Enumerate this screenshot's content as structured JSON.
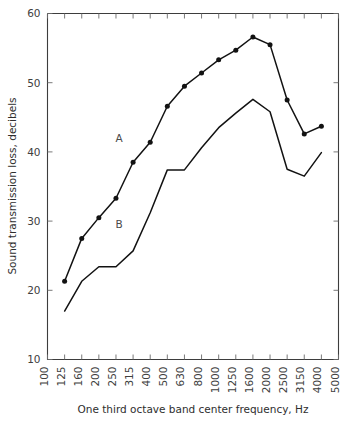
{
  "chart_data": {
    "type": "line",
    "title": "",
    "xlabel": "One third octave band center frequency, Hz",
    "ylabel": "Sound transmission loss, decibels",
    "categories": [
      "100",
      "125",
      "160",
      "200",
      "250",
      "315",
      "400",
      "500",
      "630",
      "800",
      "1000",
      "1250",
      "1600",
      "2000",
      "2500",
      "3150",
      "4000",
      "5000"
    ],
    "xtick_labels": [
      "100",
      "125",
      "160",
      "200",
      "250",
      "315",
      "400",
      "500",
      "630",
      "800",
      "1000",
      "1250",
      "1600",
      "2000",
      "2500",
      "3150",
      "4000",
      "5000"
    ],
    "ytick_labels": [
      "10",
      "20",
      "30",
      "40",
      "50",
      "60"
    ],
    "ytick_values": [
      10,
      20,
      30,
      40,
      50,
      60
    ],
    "ylim": [
      10,
      60
    ],
    "xlim_index": [
      0,
      17
    ],
    "grid": false,
    "legend_position": "inline-annotation",
    "series": [
      {
        "name": "A",
        "label": "A",
        "markers": true,
        "annotation": "A",
        "x": [
          "125",
          "160",
          "200",
          "250",
          "315",
          "400",
          "500",
          "630",
          "800",
          "1000",
          "1250",
          "1600",
          "2000",
          "2500",
          "3150",
          "4000"
        ],
        "values": [
          21.3,
          27.5,
          30.5,
          33.3,
          38.5,
          41.4,
          46.6,
          49.5,
          51.4,
          53.3,
          54.7,
          56.6,
          55.5,
          47.5,
          42.6,
          43.7
        ]
      },
      {
        "name": "B",
        "label": "B",
        "markers": false,
        "annotation": "B",
        "x": [
          "125",
          "160",
          "200",
          "250",
          "315",
          "400",
          "500",
          "630",
          "800",
          "1000",
          "1250",
          "1600",
          "2000",
          "2500",
          "3150",
          "4000"
        ],
        "values": [
          17.0,
          21.3,
          23.4,
          23.4,
          25.7,
          31.2,
          37.4,
          37.4,
          40.6,
          43.5,
          45.6,
          47.6,
          45.8,
          37.5,
          36.5,
          39.9
        ]
      }
    ],
    "annotations": [
      {
        "text": "A",
        "series": "A",
        "x": "315",
        "y": 41.5
      },
      {
        "text": "B",
        "series": "B",
        "x": "315",
        "y": 29.0
      }
    ]
  }
}
